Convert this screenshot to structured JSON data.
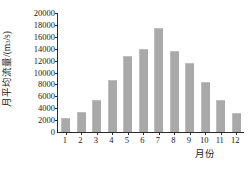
{
  "chart_data": {
    "type": "bar",
    "title": "",
    "xlabel": "月份",
    "ylabel": "月平均流量/(m³/s)",
    "ylabel_parts": {
      "prefix": "月平均流量/(m",
      "superscript": "3",
      "suffix": "/s)"
    },
    "categories": [
      "1",
      "2",
      "3",
      "4",
      "5",
      "6",
      "7",
      "8",
      "9",
      "10",
      "11",
      "12"
    ],
    "values": [
      2400,
      3400,
      5400,
      8800,
      12700,
      13900,
      17400,
      13600,
      11600,
      8400,
      5400,
      3200
    ],
    "ylim": [
      0,
      20000
    ],
    "ytick_labels": [
      "0",
      "2000",
      "4000",
      "6000",
      "8000",
      "10000",
      "12000",
      "14000",
      "16000",
      "18000",
      "20000"
    ],
    "ytick_values": [
      0,
      2000,
      4000,
      6000,
      8000,
      10000,
      12000,
      14000,
      16000,
      18000,
      20000
    ],
    "grid": false,
    "legend": null,
    "legend_position": "none",
    "bar_color": "#a9a9a9",
    "axis_color": "#2b2b2b",
    "background_color": "#ffffff"
  }
}
